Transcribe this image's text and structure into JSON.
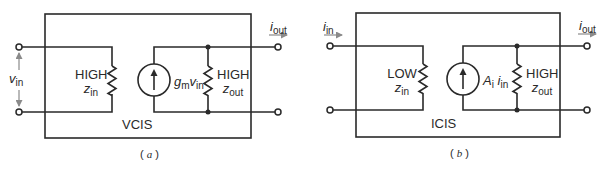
{
  "panels": [
    {
      "id": "a",
      "caption": "(a)",
      "caption_letter": "a",
      "block_name": "VCIS",
      "input_label": "v",
      "input_label_sub": "in",
      "input_type": "voltage",
      "zin_level": "HIGH",
      "zin_symbol": "z",
      "zin_sub": "in",
      "source_label": "g",
      "source_label_sub": "m",
      "source_label_var": "v",
      "source_label_var_sub": "in",
      "zout_level": "HIGH",
      "zout_symbol": "z",
      "zout_sub": "out",
      "output_label": "i",
      "output_label_sub": "out"
    },
    {
      "id": "b",
      "caption": "(b)",
      "caption_letter": "b",
      "block_name": "ICIS",
      "input_label": "i",
      "input_label_sub": "in",
      "input_type": "current",
      "zin_level": "LOW",
      "zin_symbol": "z",
      "zin_sub": "in",
      "source_label": "A",
      "source_label_sub": "i",
      "source_label_var": "i",
      "source_label_var_sub": "in",
      "zout_level": "HIGH",
      "zout_symbol": "z",
      "zout_sub": "out",
      "output_label": "i",
      "output_label_sub": "out"
    }
  ],
  "colors": {
    "line": "#2a2a2a",
    "arrow": "#8a8a8a",
    "background": "#ffffff"
  }
}
